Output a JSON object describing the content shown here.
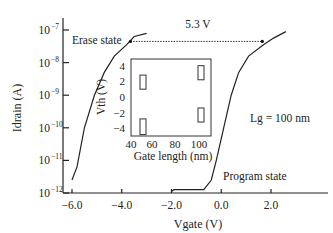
{
  "chart_data": {
    "type": "line",
    "title": "",
    "xlabel": "Vgate (V)",
    "ylabel": "Idrain (A)",
    "yscale": "log",
    "xlim": [
      -6.6,
      3.7
    ],
    "ylim_exp": [
      -12,
      -7
    ],
    "x_ticks": [
      -6.0,
      -4.0,
      -2.0,
      0.0,
      2.0
    ],
    "x_tick_labels": [
      "−6.0",
      "−4.0",
      "−2.0",
      "0.0",
      "2.0"
    ],
    "y_ticks_exp": [
      -7,
      -8,
      -9,
      -10,
      -11,
      -12
    ],
    "y_tick_labels": [
      "10",
      "10",
      "10",
      "10",
      "10",
      "10"
    ],
    "y_tick_sup": [
      "−7",
      "−8",
      "−9",
      "−10",
      "−11",
      "−12"
    ],
    "series": [
      {
        "name": "Erase state",
        "points": [
          {
            "x": -6.0,
            "log": -11.6
          },
          {
            "x": -5.8,
            "log": -11.2
          },
          {
            "x": -5.5,
            "log": -10.0
          },
          {
            "x": -5.1,
            "log": -9.0
          },
          {
            "x": -4.7,
            "log": -8.3
          },
          {
            "x": -4.3,
            "log": -7.8
          },
          {
            "x": -3.8,
            "log": -7.45
          },
          {
            "x": -3.5,
            "log": -7.2
          },
          {
            "x": -3.0,
            "log": -7.1
          }
        ]
      },
      {
        "name": "Program state",
        "points": [
          {
            "x": -2.0,
            "log": -11.95
          },
          {
            "x": -1.9,
            "log": -11.9
          },
          {
            "x": -0.7,
            "log": -11.9
          },
          {
            "x": -0.4,
            "log": -11.6
          },
          {
            "x": -0.2,
            "log": -11.0
          },
          {
            "x": 0.1,
            "log": -10.0
          },
          {
            "x": 0.4,
            "log": -9.0
          },
          {
            "x": 0.7,
            "log": -8.3
          },
          {
            "x": 1.1,
            "log": -7.8
          },
          {
            "x": 1.7,
            "log": -7.45
          },
          {
            "x": 2.1,
            "log": -7.25
          },
          {
            "x": 2.6,
            "log": -7.05
          }
        ]
      }
    ],
    "annotations": {
      "erase_label": "Erase state",
      "program_label": "Program state",
      "gate_length_label": "Lg = 100 nm",
      "window_label": "5.3 V",
      "window_arrow": {
        "x_start": -3.65,
        "x_end": 1.65,
        "log": -7.35
      }
    },
    "inset": {
      "type": "box",
      "xlabel": "Gate length (nm)",
      "ylabel": "Vth (V)",
      "xlim": [
        40,
        105
      ],
      "ylim": [
        -5,
        5
      ],
      "x_ticks": [
        40,
        60,
        80,
        100
      ],
      "x_tick_labels": [
        "40",
        "60",
        "80",
        "100"
      ],
      "y_ticks": [
        4,
        2,
        0,
        -2,
        -4
      ],
      "y_tick_labels": [
        "4",
        "2",
        "0",
        "−2",
        "−4"
      ],
      "boxes": [
        {
          "x": 50,
          "low": 1.0,
          "high": 2.8
        },
        {
          "x": 50,
          "low": -4.8,
          "high": -2.8
        },
        {
          "x": 100,
          "low": 2.2,
          "high": 4.0
        },
        {
          "x": 100,
          "low": -3.2,
          "high": -1.4
        }
      ]
    }
  }
}
